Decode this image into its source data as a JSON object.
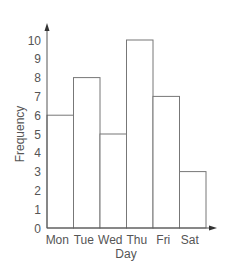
{
  "chart_data": {
    "type": "bar",
    "title": "",
    "xlabel": "Day",
    "ylabel": "Frequency",
    "categories": [
      "Mon",
      "Tue",
      "Wed",
      "Thu",
      "Fri",
      "Sat"
    ],
    "values": [
      6,
      8,
      5,
      10,
      7,
      3
    ],
    "ylim": [
      0,
      10
    ],
    "yticks": [
      0,
      1,
      2,
      3,
      4,
      5,
      6,
      7,
      8,
      9,
      10
    ],
    "grid": false,
    "legend": null,
    "bar_style": "outlined, no fill, adjacent (histogram-style)"
  },
  "colors": {
    "axis": "#555555",
    "bar_stroke": "#777777",
    "bar_fill": "#ffffff",
    "text": "#555555"
  }
}
